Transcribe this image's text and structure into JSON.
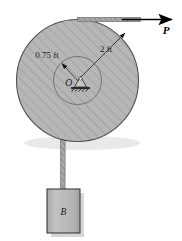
{
  "figure": {
    "labels": {
      "inner_radius": "0.75 ft",
      "outer_radius": "2 ft",
      "center": "O",
      "block": "B",
      "force": "P"
    },
    "colors": {
      "disk_fill": "#b6b6b6",
      "disk_hatch": "#8f8f8f",
      "disk_stroke": "#4a4a4a",
      "hub_stroke": "#6e6e6e",
      "rope": "#9a9a9a",
      "rope_stroke": "#5a5a5a",
      "block_fill": "#b8b8b8",
      "block_stroke": "#3c3c3c",
      "shadow": "#d2d2d2",
      "text": "#1a1a1a",
      "arrow": "#000000"
    },
    "geometry": {
      "disk_center_x": 77.5,
      "disk_center_y": 80.5,
      "disk_radius": 61,
      "hub_radius": 24,
      "rope_top_y": 19.5,
      "arrow_tip_x": 176,
      "block_x": 47,
      "block_y": 189,
      "block_w": 33,
      "block_h": 44
    },
    "annotations": [
      {
        "name": "outer-radius-dimension",
        "text": "2 ft",
        "value": 2,
        "unit": "ft"
      },
      {
        "name": "inner-radius-dimension",
        "text": "0.75 ft",
        "value": 0.75,
        "unit": "ft"
      },
      {
        "name": "center-point",
        "text": "O"
      },
      {
        "name": "applied-force",
        "text": "P"
      },
      {
        "name": "hanging-block",
        "text": "B"
      }
    ]
  }
}
